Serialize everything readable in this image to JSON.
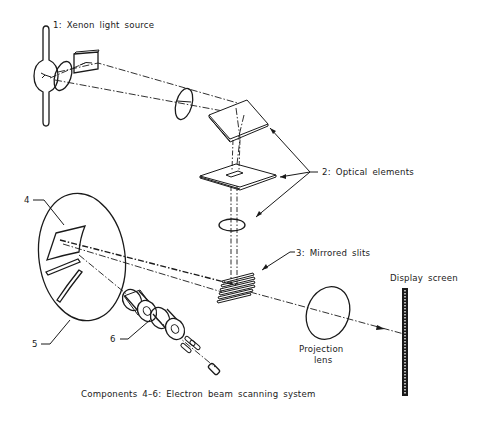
{
  "diagram": {
    "type": "optical-system-schematic",
    "labels": {
      "light_source": "1:  Xenon  light  source",
      "optical_elements": "2:  Optical  elements",
      "mirrored_slits": "3:  Mirrored  slits",
      "display_screen": "Display  screen",
      "projection_lens_line1": "Projection",
      "projection_lens_line2": "lens",
      "callout_4": "4",
      "callout_5": "5",
      "callout_6": "6",
      "caption": "Components  4–6:   Electron  beam  scanning  system"
    },
    "components": [
      {
        "id": 1,
        "name": "Xenon light source"
      },
      {
        "id": 2,
        "name": "Optical elements",
        "count": 3
      },
      {
        "id": 3,
        "name": "Mirrored slits"
      },
      {
        "id": 4,
        "name": "Electron beam target"
      },
      {
        "id": 5,
        "name": "Scanning chamber"
      },
      {
        "id": 6,
        "name": "Deflection coils"
      },
      {
        "id": "projection-lens",
        "name": "Projection lens"
      },
      {
        "id": "display-screen",
        "name": "Display screen"
      }
    ],
    "colors": {
      "line": "#1a1a1a",
      "background": "#ffffff"
    }
  }
}
